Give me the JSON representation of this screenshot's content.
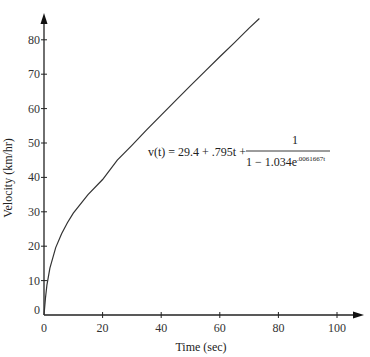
{
  "chart_data": {
    "type": "line",
    "title": "",
    "xlabel": "Time (sec)",
    "ylabel": "Velocity (km/hr)",
    "xlim": [
      0,
      100
    ],
    "ylim": [
      0,
      85
    ],
    "x_ticks": [
      0,
      20,
      40,
      60,
      80,
      100
    ],
    "y_ticks": [
      0,
      10,
      20,
      30,
      40,
      50,
      60,
      70,
      80
    ],
    "grid": false,
    "legend": null,
    "annotation": {
      "lhs": "v(t) = 29.4 + .795t +",
      "numerator": "1",
      "denominator_base": "1 − 1.034e",
      "denominator_exponent": ".0061667t"
    },
    "series": [
      {
        "name": "v(t)",
        "x": [
          0,
          0.5,
          1,
          2,
          4,
          6,
          8,
          10,
          15,
          20,
          25,
          30,
          35,
          40,
          45,
          50,
          55,
          60,
          65,
          70,
          73.5
        ],
        "y": [
          0,
          5.0,
          8.7,
          13.6,
          19.6,
          23.6,
          26.8,
          29.6,
          35.0,
          39.4,
          45.0,
          49.3,
          53.8,
          58.1,
          62.4,
          66.7,
          70.9,
          75.1,
          79.2,
          83.4,
          86.2
        ]
      }
    ]
  }
}
